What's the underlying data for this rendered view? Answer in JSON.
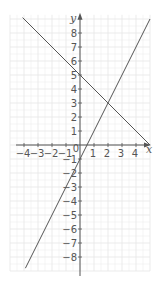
{
  "chart_data": {
    "type": "line",
    "title": "",
    "xlabel": "x",
    "ylabel": "y",
    "xlim": [
      -5,
      5
    ],
    "ylim": [
      -9,
      9.3
    ],
    "grid": true,
    "legend": null,
    "x_ticks": [
      -4,
      -3,
      -2,
      -1,
      0,
      1,
      2,
      3,
      4
    ],
    "y_ticks": [
      -8,
      -7,
      -6,
      -5,
      -4,
      -3,
      -2,
      -1,
      1,
      2,
      3,
      4,
      5,
      6,
      7,
      8
    ],
    "series": [
      {
        "name": "y = -x + 5",
        "x": [
          -4.1,
          5
        ],
        "y": [
          9.1,
          0
        ],
        "color": "#555555"
      },
      {
        "name": "y = 2x - 1",
        "x": [
          -3.9,
          5
        ],
        "y": [
          -8.8,
          9
        ],
        "color": "#555555"
      }
    ],
    "intersection": {
      "x": 2,
      "y": 3
    }
  },
  "labels": {
    "x_axis": "x",
    "y_axis": "y",
    "origin": "0"
  },
  "colors": {
    "grid": "#e6e6e6",
    "axis": "#555555",
    "line": "#555555"
  }
}
